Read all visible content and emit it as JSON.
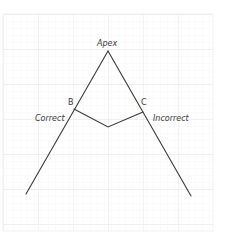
{
  "diagram": {
    "type": "funnel-angle-diagram",
    "labels": {
      "apex": "Apex",
      "point_b": "B",
      "point_c": "C",
      "left_branch": "Correct",
      "right_branch": "Incorrect"
    },
    "points": {
      "apex": [
        108,
        51
      ],
      "b": [
        74,
        109
      ],
      "c": [
        143,
        112
      ],
      "inner_vertex": [
        108,
        127
      ],
      "left_end": [
        26,
        194
      ],
      "right_end": [
        191,
        196
      ]
    },
    "grid": {
      "x": 3,
      "y": 14,
      "width": 210,
      "height": 217,
      "minor_spacing": 7,
      "major_spacing": 35
    },
    "colors": {
      "background": "#ffffff",
      "grid_minor": "#f0f0f0",
      "grid_major": "#e2e2e2",
      "line": "#3a3a3a",
      "text": "#3a3a3a"
    }
  }
}
